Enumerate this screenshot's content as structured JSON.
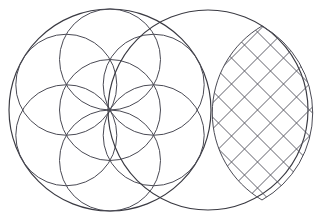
{
  "canvas": {
    "width": 319,
    "height": 223,
    "background": "#ffffff",
    "title": "Seed of Life and latticed vesica piscis"
  },
  "colors": {
    "outline": "#3a3a42",
    "inner_circle": "#4a4a54",
    "lattice": "#565661",
    "background": "#ffffff"
  },
  "figures": {
    "left": {
      "name": "seed-of-life",
      "outer_circle": {
        "cx": 110,
        "cy": 110,
        "r": 101
      },
      "inner_radius": 50.5,
      "inner_centers": [
        {
          "cx": 110,
          "cy": 110
        },
        {
          "cx": 110,
          "cy": 59.5
        },
        {
          "cx": 153.7,
          "cy": 84.75
        },
        {
          "cx": 153.7,
          "cy": 135.25
        },
        {
          "cx": 110,
          "cy": 160.5
        },
        {
          "cx": 66.3,
          "cy": 135.25
        },
        {
          "cx": 66.3,
          "cy": 84.75
        }
      ]
    },
    "right": {
      "name": "latticed-vesica",
      "outer_circle": {
        "cx": 208,
        "cy": 110,
        "r": 100
      },
      "vesica": {
        "left_arc_center": {
          "cx": 110,
          "cy": 110,
          "r": 101
        },
        "right_arc_center": {
          "cx": 208,
          "cy": 110,
          "r": 100
        },
        "top_tip": {
          "x": 262,
          "y": 26
        },
        "bottom_tip": {
          "x": 262,
          "y": 200
        },
        "left_point": {
          "x": 207,
          "y": 110
        },
        "right_point": {
          "x": 308,
          "y": 110
        }
      },
      "lattice": {
        "spacing": 26,
        "angle_deg": 45,
        "direction_count": 2
      }
    }
  }
}
